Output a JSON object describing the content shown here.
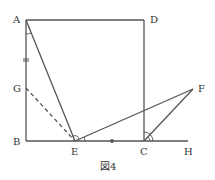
{
  "figure": {
    "caption": "図4",
    "colors": {
      "stroke": "#555555",
      "text": "#333333",
      "background": "#ffffff"
    },
    "points": {
      "A": {
        "label": "A",
        "x": 26,
        "y": 20
      },
      "D": {
        "label": "D",
        "x": 144,
        "y": 20
      },
      "B": {
        "label": "B",
        "x": 26,
        "y": 141
      },
      "C": {
        "label": "C",
        "x": 144,
        "y": 141
      },
      "E": {
        "label": "E",
        "x": 75,
        "y": 141
      },
      "G": {
        "label": "G",
        "x": 26,
        "y": 88
      },
      "F": {
        "label": "F",
        "x": 193,
        "y": 89
      },
      "H": {
        "label": "H",
        "x": 188,
        "y": 141
      }
    },
    "segments": [
      {
        "from": "A",
        "to": "D",
        "style": "solid"
      },
      {
        "from": "D",
        "to": "C",
        "style": "solid"
      },
      {
        "from": "A",
        "to": "B",
        "style": "solid"
      },
      {
        "from": "B",
        "to": "H",
        "style": "solid"
      },
      {
        "from": "A",
        "to": "E",
        "style": "solid"
      },
      {
        "from": "E",
        "to": "F",
        "style": "solid"
      },
      {
        "from": "C",
        "to": "F",
        "style": "solid"
      },
      {
        "from": "G",
        "to": "E",
        "style": "dashed"
      }
    ],
    "equal_marks": [
      "AG",
      "EC"
    ],
    "angle_marks": [
      "BAE",
      "AEF",
      "FEC",
      "DCF"
    ]
  }
}
